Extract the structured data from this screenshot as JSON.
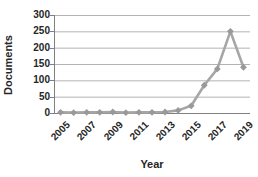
{
  "chart_data": {
    "type": "line",
    "title": "",
    "xlabel": "Year",
    "ylabel": "Documents",
    "x": [
      2005,
      2006,
      2007,
      2008,
      2009,
      2010,
      2011,
      2012,
      2013,
      2014,
      2015,
      2016,
      2017,
      2018,
      2019
    ],
    "series": [
      {
        "name": "Documents",
        "values": [
          2,
          1,
          2,
          2,
          3,
          1,
          2,
          2,
          3,
          8,
          22,
          85,
          135,
          250,
          140
        ]
      }
    ],
    "ylim": [
      0,
      300
    ],
    "yticks": [
      0,
      50,
      100,
      150,
      200,
      250,
      300
    ],
    "xticks_shown": [
      "2005",
      "2007",
      "2009",
      "2011",
      "2013",
      "2015",
      "2017",
      "2019"
    ],
    "grid": "horizontal",
    "legend": "none",
    "marker": "diamond",
    "colors": {
      "line": "#a6a6a6",
      "marker": "#999999",
      "gridline": "#b3b3b3",
      "axis": "#808080",
      "text": "#262626",
      "background": "#ffffff"
    }
  }
}
